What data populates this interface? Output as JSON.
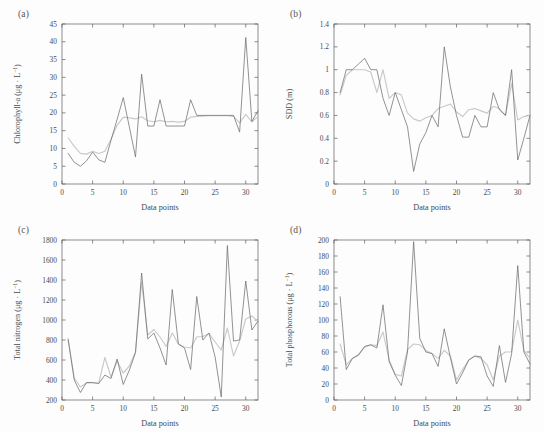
{
  "figure": {
    "background": "#fdfdfd",
    "observed_color": "#6f6f6f",
    "predicted_color": "#c9c9c9"
  },
  "panels": [
    {
      "label": "(a)",
      "name": "chlorophyll-a"
    },
    {
      "label": "(b)",
      "name": "sdd"
    },
    {
      "label": "(c)",
      "name": "total-nitrogen"
    },
    {
      "label": "(d)",
      "name": "total-phosphorous"
    }
  ],
  "chart_data": [
    {
      "type": "line",
      "panel": "(a)",
      "title": "",
      "xlabel": "Data points",
      "ylabel": "Chlorophyll-a (μg · L⁻¹)",
      "ylabel_base": "Chlorophyll-a (μg · L",
      "ylabel_sup": "−1",
      "ylabel_tail": ")",
      "xlim": [
        0,
        32
      ],
      "ylim": [
        0,
        45
      ],
      "xticks": [
        0,
        5,
        10,
        15,
        20,
        25,
        30
      ],
      "yticks": [
        0,
        5,
        10,
        15,
        20,
        25,
        30,
        35,
        40,
        45
      ],
      "grid": false,
      "legend": "none",
      "x": [
        1,
        2,
        3,
        4,
        5,
        6,
        7,
        8,
        9,
        10,
        11,
        12,
        13,
        14,
        15,
        16,
        17,
        18,
        19,
        20,
        21,
        22,
        23,
        24,
        25,
        26,
        27,
        28,
        29,
        30,
        31,
        32
      ],
      "series": [
        {
          "name": "Observed",
          "color": "#6f6f6f",
          "values": [
            8.6,
            6.1,
            5.0,
            6.5,
            9.0,
            6.8,
            6.1,
            12.3,
            18.2,
            24.3,
            16.0,
            7.6,
            30.9,
            16.3,
            16.3,
            23.7,
            16.3,
            16.3,
            16.3,
            16.3,
            23.7,
            19.3,
            19.3,
            19.3,
            19.3,
            19.3,
            19.3,
            19.3,
            14.6,
            41.2,
            17.6,
            20.6
          ]
        },
        {
          "name": "Predicted",
          "color": "#c9c9c9",
          "values": [
            13.0,
            10.6,
            8.6,
            8.4,
            9.2,
            8.6,
            9.2,
            12.6,
            16.5,
            18.8,
            18.6,
            18.3,
            18.9,
            17.8,
            17.5,
            17.9,
            17.5,
            17.6,
            17.4,
            17.6,
            18.8,
            19.0,
            19.1,
            19.2,
            19.2,
            19.2,
            19.2,
            19.0,
            17.2,
            19.6,
            17.5,
            19.0
          ]
        }
      ]
    },
    {
      "type": "line",
      "panel": "(b)",
      "title": "",
      "xlabel": "Data points",
      "ylabel": "SDD (m)",
      "xlim": [
        0,
        32
      ],
      "ylim": [
        0,
        1.4
      ],
      "xticks": [
        0,
        5,
        10,
        15,
        20,
        25,
        30
      ],
      "yticks": [
        0,
        0.2,
        0.4,
        0.6,
        0.8,
        1.0,
        1.2,
        1.4
      ],
      "ytick_labels": [
        "0",
        "0.2",
        "0.4",
        "0.6",
        "0.8",
        "1",
        "1.2",
        "1.4"
      ],
      "grid": false,
      "legend": "none",
      "x": [
        1,
        2,
        3,
        4,
        5,
        6,
        7,
        8,
        9,
        10,
        11,
        12,
        13,
        14,
        15,
        16,
        17,
        18,
        19,
        20,
        21,
        22,
        23,
        24,
        25,
        26,
        27,
        28,
        29,
        30,
        31,
        32
      ],
      "series": [
        {
          "name": "Observed",
          "color": "#6f6f6f",
          "values": [
            0.8,
            1.0,
            1.0,
            1.05,
            1.1,
            1.0,
            1.0,
            0.75,
            0.6,
            0.8,
            0.65,
            0.5,
            0.11,
            0.35,
            0.45,
            0.6,
            0.5,
            1.2,
            0.85,
            0.6,
            0.41,
            0.41,
            0.6,
            0.5,
            0.5,
            0.8,
            0.65,
            0.6,
            1.0,
            0.21,
            0.4,
            0.6
          ]
        },
        {
          "name": "Predicted",
          "color": "#c9c9c9",
          "values": [
            0.78,
            0.95,
            1.0,
            1.0,
            1.0,
            0.98,
            0.8,
            1.0,
            0.75,
            0.8,
            0.78,
            0.62,
            0.57,
            0.55,
            0.58,
            0.6,
            0.66,
            0.68,
            0.7,
            0.63,
            0.59,
            0.65,
            0.66,
            0.64,
            0.62,
            0.68,
            0.66,
            0.6,
            0.88,
            0.56,
            0.59,
            0.6
          ]
        }
      ]
    },
    {
      "type": "line",
      "panel": "(c)",
      "title": "",
      "xlabel": "Data points",
      "ylabel": "Total nitrogen (μg · L⁻¹)",
      "ylabel_base": "Total nitrogen (μg · L",
      "ylabel_sup": "−1",
      "ylabel_tail": ")",
      "xlim": [
        0,
        32
      ],
      "ylim": [
        200,
        1800
      ],
      "xticks": [
        0,
        5,
        10,
        15,
        20,
        25,
        30
      ],
      "yticks": [
        200,
        400,
        600,
        800,
        1000,
        1200,
        1400,
        1600,
        1800
      ],
      "grid": false,
      "legend": "none",
      "x": [
        1,
        2,
        3,
        4,
        5,
        6,
        7,
        8,
        9,
        10,
        11,
        12,
        13,
        14,
        15,
        16,
        17,
        18,
        19,
        20,
        21,
        22,
        23,
        24,
        25,
        26,
        27,
        28,
        29,
        30,
        31,
        32
      ],
      "series": [
        {
          "name": "Observed",
          "color": "#6f6f6f",
          "values": [
            810,
            400,
            275,
            375,
            375,
            365,
            450,
            415,
            610,
            355,
            500,
            675,
            1470,
            810,
            870,
            720,
            550,
            1305,
            760,
            720,
            505,
            1235,
            800,
            870,
            630,
            230,
            1745,
            790,
            800,
            1390,
            900,
            990
          ]
        },
        {
          "name": "Predicted",
          "color": "#c9c9c9",
          "values": [
            800,
            420,
            330,
            370,
            370,
            370,
            625,
            430,
            590,
            470,
            540,
            680,
            1380,
            850,
            905,
            830,
            735,
            870,
            760,
            730,
            720,
            830,
            835,
            865,
            780,
            700,
            920,
            640,
            790,
            1010,
            1040,
            985
          ]
        }
      ]
    },
    {
      "type": "line",
      "panel": "(d)",
      "title": "",
      "xlabel": "Data points",
      "ylabel": "Total phosphorous (μg · L⁻¹)",
      "ylabel_base": "Total phosphorous (μg · L",
      "ylabel_sup": "−1",
      "ylabel_tail": ")",
      "xlim": [
        0,
        32
      ],
      "ylim": [
        0,
        200
      ],
      "xticks": [
        0,
        5,
        10,
        15,
        20,
        25,
        30
      ],
      "yticks": [
        0,
        20,
        40,
        60,
        80,
        100,
        120,
        140,
        160,
        180,
        200
      ],
      "grid": false,
      "legend": "none",
      "x": [
        1,
        2,
        3,
        4,
        5,
        6,
        7,
        8,
        9,
        10,
        11,
        12,
        13,
        14,
        15,
        16,
        17,
        18,
        19,
        20,
        21,
        22,
        23,
        24,
        25,
        26,
        27,
        28,
        29,
        30,
        31,
        32
      ],
      "series": [
        {
          "name": "Observed",
          "color": "#6f6f6f",
          "values": [
            129,
            38,
            52,
            56,
            67,
            69,
            65,
            119,
            48,
            31,
            18,
            60,
            198,
            77,
            60,
            58,
            42,
            89,
            53,
            20,
            34,
            50,
            55,
            54,
            30,
            17,
            68,
            22,
            58,
            168,
            60,
            45
          ]
        },
        {
          "name": "Predicted",
          "color": "#c9c9c9",
          "values": [
            70,
            44,
            52,
            57,
            66,
            69,
            68,
            85,
            50,
            32,
            30,
            63,
            70,
            69,
            62,
            58,
            52,
            62,
            55,
            25,
            38,
            50,
            55,
            52,
            44,
            25,
            55,
            60,
            60,
            100,
            62,
            52
          ]
        }
      ]
    }
  ]
}
